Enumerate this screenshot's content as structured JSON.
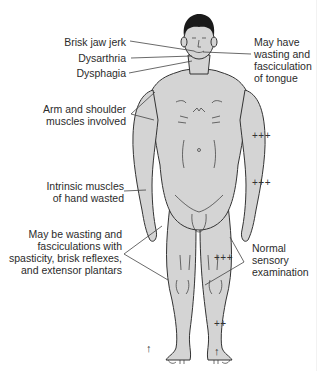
{
  "diagram": {
    "colors": {
      "skin": "#d4d4d4",
      "outline": "#333333",
      "hair": "#1a1a1a",
      "text": "#2b2b2b",
      "leader": "#444444"
    },
    "labels_left": [
      {
        "id": "jaw",
        "text": "Brisk jaw jerk"
      },
      {
        "id": "dysarthria",
        "text": "Dysarthria"
      },
      {
        "id": "dysphagia",
        "text": "Dysphagia"
      },
      {
        "id": "arm",
        "lines": [
          "Arm and shoulder",
          "muscles involved"
        ]
      },
      {
        "id": "hand",
        "lines": [
          "Intrinsic muscles",
          "of hand wasted"
        ]
      },
      {
        "id": "legs",
        "lines": [
          "May be wasting and",
          "fasciculations with",
          "spasticity, brisk reflexes,",
          "and extensor plantars"
        ]
      }
    ],
    "labels_right": [
      {
        "id": "tongue",
        "lines": [
          "May have",
          "wasting and",
          "fasciculation",
          "of tongue"
        ]
      },
      {
        "id": "sensory",
        "lines": [
          "Normal",
          "sensory",
          "examination"
        ]
      }
    ],
    "reflex_grades": [
      {
        "id": "biceps",
        "text": "+++"
      },
      {
        "id": "supinator",
        "text": "+++"
      },
      {
        "id": "knee",
        "text": "+++"
      },
      {
        "id": "ankle",
        "text": "++"
      }
    ],
    "plantar_arrows": [
      {
        "id": "left-plantar",
        "text": "↑"
      },
      {
        "id": "right-plantar",
        "text": "↑"
      }
    ]
  }
}
